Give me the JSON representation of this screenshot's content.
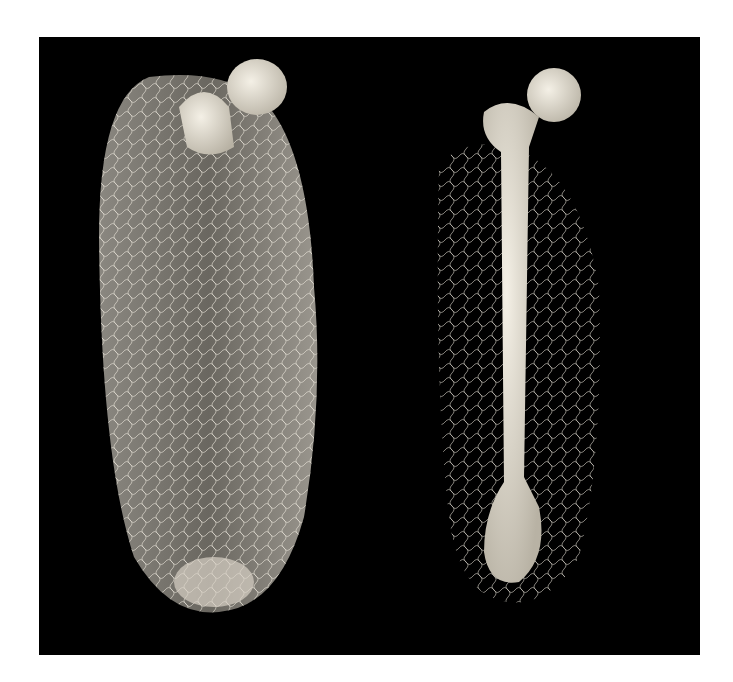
{
  "image": {
    "description": "3D renderings of two bones with surrounding vascular networks on a black background",
    "background_color": "#000000",
    "border_color": "#ffffff",
    "subjects": [
      {
        "name": "left-specimen",
        "label": "bone with dense vasculature envelope"
      },
      {
        "name": "right-specimen",
        "label": "femur with surrounding vessels"
      }
    ]
  }
}
